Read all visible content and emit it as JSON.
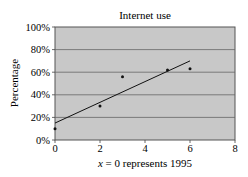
{
  "chart_data": {
    "type": "scatter",
    "title": "Internet use",
    "xlabel": "x = 0 represents 1995",
    "ylabel": "Percentage",
    "xlim": [
      0,
      8
    ],
    "ylim": [
      0,
      100
    ],
    "x_ticks": [
      "0",
      "2",
      "4",
      "6",
      "8"
    ],
    "y_ticks": [
      "0%",
      "20%",
      "40%",
      "60%",
      "80%",
      "100%"
    ],
    "grid": "horizontal",
    "plot_background": "#c8c8c8",
    "points": [
      {
        "x": 0,
        "y": 10
      },
      {
        "x": 2,
        "y": 30
      },
      {
        "x": 3,
        "y": 56
      },
      {
        "x": 5,
        "y": 62
      },
      {
        "x": 6,
        "y": 63
      }
    ],
    "trendline": {
      "x0": 0,
      "y0": 15,
      "x1": 6,
      "y1": 70
    }
  }
}
